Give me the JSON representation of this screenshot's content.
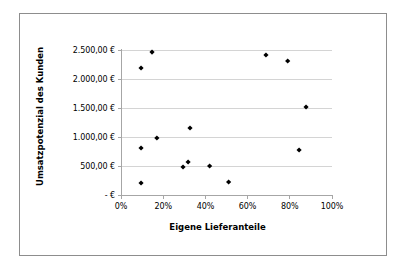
{
  "figure": {
    "background": "#ffffff",
    "frame_border_color": "#8d8d8d",
    "gridline_color": "#d4d4d4",
    "axis_color": "#a6a6a6",
    "marker_color": "#000000"
  },
  "chart_data": {
    "type": "scatter",
    "title": "",
    "xlabel": "Eigene Lieferanteile",
    "ylabel": "Umsatzpotenzial des Kunden",
    "xlim": [
      0,
      100
    ],
    "ylim": [
      0,
      2500
    ],
    "grid": true,
    "legend": "none",
    "x_tick_labels": [
      "0%",
      "20%",
      "40%",
      "60%",
      "80%",
      "100%"
    ],
    "x_tick_values": [
      0,
      20,
      40,
      60,
      80,
      100
    ],
    "y_tick_labels": [
      "-   €",
      "500,00 €",
      "1.000,00 €",
      "1.500,00 €",
      "2.000,00 €",
      "2.500,00 €"
    ],
    "y_tick_values": [
      0,
      500,
      1000,
      1500,
      2000,
      2500
    ],
    "series": [
      {
        "name": "Kunden",
        "marker": "diamond",
        "color": "#000000",
        "points": [
          {
            "x": 9.5,
            "y": 2190
          },
          {
            "x": 14.7,
            "y": 2465
          },
          {
            "x": 9.5,
            "y": 810
          },
          {
            "x": 9.5,
            "y": 207
          },
          {
            "x": 17.0,
            "y": 983
          },
          {
            "x": 29.4,
            "y": 483
          },
          {
            "x": 31.8,
            "y": 569
          },
          {
            "x": 32.7,
            "y": 1155
          },
          {
            "x": 42.0,
            "y": 500
          },
          {
            "x": 51.0,
            "y": 224
          },
          {
            "x": 68.7,
            "y": 2414
          },
          {
            "x": 79.0,
            "y": 2310
          },
          {
            "x": 84.4,
            "y": 776
          },
          {
            "x": 87.7,
            "y": 1517
          }
        ]
      }
    ]
  }
}
